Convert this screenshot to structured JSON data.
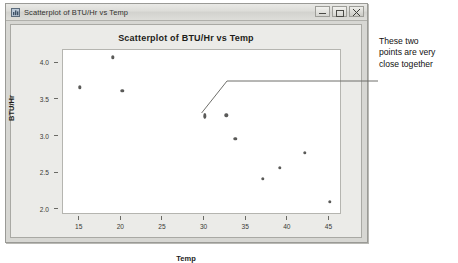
{
  "window": {
    "title": "Scatterplot of BTU/Hr vs Temp",
    "icon": "chart-window-icon",
    "controls": {
      "minimize_label": "Minimize",
      "maximize_label": "Maximize",
      "close_label": "Close"
    }
  },
  "annotation": {
    "text": "These two points are very close together",
    "line1": "These two",
    "line2": "points are very",
    "line3": "close together"
  },
  "colors": {
    "marker": "#5a5a58",
    "plot_background": "#ffffff",
    "panel_background": "#ebebe8",
    "window_chrome": "#d7d7d3",
    "text": "#1d1d1a"
  },
  "chart_data": {
    "type": "scatter",
    "title": "Scatterplot of BTU/Hr vs Temp",
    "xlabel": "Temp",
    "ylabel": "BTU/Hr",
    "xlim": [
      13,
      46.5
    ],
    "ylim": [
      1.93,
      4.18
    ],
    "xticks": [
      15,
      20,
      25,
      30,
      35,
      40,
      45
    ],
    "xtick_labels": [
      "15",
      "20",
      "25",
      "30",
      "35",
      "40",
      "45"
    ],
    "yticks": [
      2.0,
      2.5,
      3.0,
      3.5,
      4.0
    ],
    "ytick_labels": [
      "2.0",
      "2.5",
      "3.0",
      "3.5",
      "4.0"
    ],
    "grid": false,
    "legend": null,
    "points": [
      {
        "x": 15.0,
        "y": 3.67,
        "kind": "single"
      },
      {
        "x": 19.0,
        "y": 4.08,
        "kind": "single"
      },
      {
        "x": 20.1,
        "y": 3.62,
        "kind": "single"
      },
      {
        "x": 30.0,
        "y": 3.28,
        "kind": "overlapping-pair",
        "note": "two points very close together"
      },
      {
        "x": 32.6,
        "y": 3.29,
        "kind": "single"
      },
      {
        "x": 33.7,
        "y": 2.97,
        "kind": "single"
      },
      {
        "x": 42.0,
        "y": 2.78,
        "kind": "single"
      },
      {
        "x": 39.0,
        "y": 2.57,
        "kind": "single"
      },
      {
        "x": 37.0,
        "y": 2.42,
        "kind": "single"
      },
      {
        "x": 45.0,
        "y": 2.11,
        "kind": "single"
      }
    ],
    "annotations": [
      {
        "text": "These two points are very close together",
        "target_x": 30.0,
        "target_y": 3.28,
        "leader": "elbow"
      }
    ]
  }
}
